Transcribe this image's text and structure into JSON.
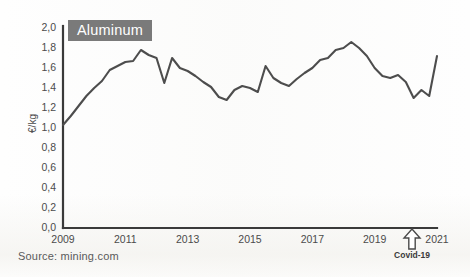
{
  "figure": {
    "series_badge": "Aluminum",
    "source_note": "Source: mining.com",
    "covid_annotation": "Covid-19",
    "line_color": "#4d4d4d",
    "badge_bg_color": "#7a7a7a",
    "badge_text_color": "#ffffff",
    "axis_color": "#3a3a3a"
  },
  "chart_data": {
    "type": "line",
    "title": "Aluminum",
    "xlabel": "",
    "ylabel": "€/kg",
    "xlim": [
      2009,
      2021
    ],
    "ylim": [
      0.0,
      2.0
    ],
    "grid": false,
    "legend": "none",
    "y_ticks": [
      "0,0",
      "0,2",
      "0,4",
      "0,6",
      "0,8",
      "1,0",
      "1,2",
      "1,4",
      "1,6",
      "1,8",
      "2,0"
    ],
    "y_tick_values": [
      0.0,
      0.2,
      0.4,
      0.6,
      0.8,
      1.0,
      1.2,
      1.4,
      1.6,
      1.8,
      2.0
    ],
    "x_ticks": [
      "2009",
      "2011",
      "2013",
      "2015",
      "2017",
      "2019",
      "2021"
    ],
    "x_tick_values": [
      2009,
      2011,
      2013,
      2015,
      2017,
      2019,
      2021
    ],
    "annotations": [
      {
        "label": "Covid-19",
        "x": 2020.2,
        "type": "up-arrow"
      }
    ],
    "series": [
      {
        "name": "Aluminum",
        "unit": "€/kg",
        "color": "#4d4d4d",
        "x": [
          2009.0,
          2009.25,
          2009.5,
          2009.75,
          2010.0,
          2010.25,
          2010.5,
          2010.75,
          2011.0,
          2011.25,
          2011.5,
          2011.75,
          2012.0,
          2012.25,
          2012.5,
          2012.75,
          2013.0,
          2013.25,
          2013.5,
          2013.75,
          2014.0,
          2014.25,
          2014.5,
          2014.75,
          2015.0,
          2015.25,
          2015.5,
          2015.75,
          2016.0,
          2016.25,
          2016.5,
          2016.75,
          2017.0,
          2017.25,
          2017.5,
          2017.75,
          2018.0,
          2018.25,
          2018.5,
          2018.75,
          2019.0,
          2019.25,
          2019.5,
          2019.75,
          2020.0,
          2020.25,
          2020.5,
          2020.75,
          2021.0
        ],
        "y": [
          1.03,
          1.12,
          1.22,
          1.32,
          1.4,
          1.47,
          1.58,
          1.62,
          1.66,
          1.67,
          1.78,
          1.73,
          1.7,
          1.45,
          1.7,
          1.6,
          1.57,
          1.52,
          1.46,
          1.41,
          1.31,
          1.28,
          1.38,
          1.42,
          1.4,
          1.36,
          1.62,
          1.5,
          1.45,
          1.42,
          1.49,
          1.55,
          1.6,
          1.68,
          1.7,
          1.78,
          1.8,
          1.86,
          1.8,
          1.72,
          1.6,
          1.52,
          1.5,
          1.53,
          1.46,
          1.3,
          1.38,
          1.32,
          1.72
        ]
      }
    ]
  }
}
